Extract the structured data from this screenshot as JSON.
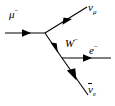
{
  "diagram": {
    "type": "feynman-diagram",
    "background_color": "#ffffff",
    "line_color": "#000000",
    "canvas": {
      "width": 115,
      "height": 106
    },
    "vertices": [
      {
        "name": "vertex-1",
        "x": 45,
        "y": 33
      },
      {
        "name": "vertex-2",
        "x": 62,
        "y": 58
      }
    ],
    "labels": {
      "muon": {
        "base": "μ",
        "superscript": "−"
      },
      "muon_neutrino": {
        "base": "ν",
        "subscript": "μ"
      },
      "w_boson": {
        "base": "W",
        "superscript": "−"
      },
      "electron": {
        "base": "e",
        "superscript": "−"
      },
      "electron_antineutrino": {
        "base": "ν",
        "subscript": "e",
        "overbar": true
      }
    },
    "lines": [
      {
        "name": "muon-line",
        "particle": "muon",
        "from": {
          "x": 5,
          "y": 33
        },
        "to": {
          "x": 45,
          "y": 33
        },
        "arrow": "forward",
        "arrow_at": {
          "x": 26,
          "y": 33
        }
      },
      {
        "name": "muon-neutrino-line",
        "particle": "muon_neutrino",
        "from": {
          "x": 45,
          "y": 33
        },
        "to": {
          "x": 87,
          "y": 7
        },
        "arrow": "forward",
        "arrow_at": {
          "x": 68,
          "y": 19
        }
      },
      {
        "name": "w-boson-line",
        "particle": "w_boson",
        "from": {
          "x": 45,
          "y": 33
        },
        "to": {
          "x": 62,
          "y": 58
        },
        "arrow": "forward",
        "arrow_at": {
          "x": 56,
          "y": 48
        }
      },
      {
        "name": "electron-line",
        "particle": "electron",
        "from": {
          "x": 62,
          "y": 58
        },
        "to": {
          "x": 111,
          "y": 58
        },
        "arrow": "forward",
        "arrow_at": {
          "x": 88,
          "y": 58
        }
      },
      {
        "name": "electron-antineutrino-line",
        "particle": "electron_antineutrino",
        "from": {
          "x": 88,
          "y": 95
        },
        "to": {
          "x": 62,
          "y": 58
        },
        "arrow": "forward",
        "arrow_at": {
          "x": 73,
          "y": 74
        }
      }
    ]
  }
}
